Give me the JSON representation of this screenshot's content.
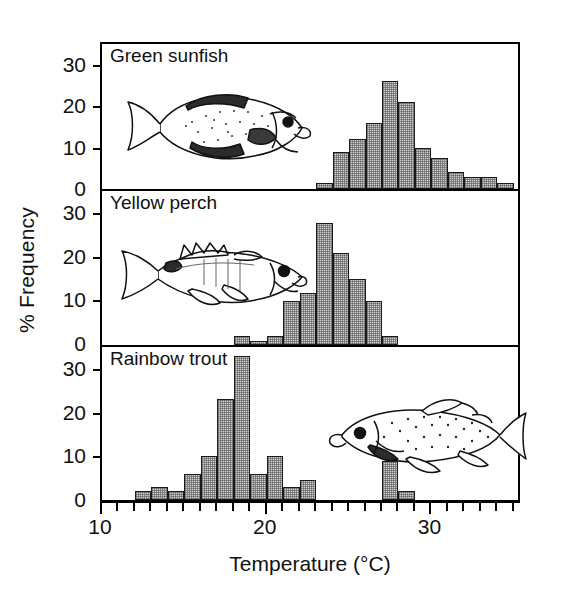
{
  "figure": {
    "xlabel": "Temperature (°C)",
    "ylabel": "% Frequency"
  },
  "axis": {
    "x_major_labels": [
      "10",
      "20",
      "30"
    ],
    "x_major_values": [
      10,
      20,
      30
    ],
    "x_min": 10,
    "x_max": 35.5,
    "x_tick_step": 1,
    "y_labels": [
      "0",
      "10",
      "20",
      "30"
    ],
    "y_values": [
      0,
      10,
      20,
      30
    ]
  },
  "panels": [
    {
      "title": "Green sunfish",
      "fish": "green-sunfish",
      "ymax": 35,
      "ticks": [
        0,
        10,
        20,
        30
      ]
    },
    {
      "title": "Yellow perch",
      "fish": "yellow-perch",
      "ymax": 35,
      "ticks": [
        0,
        10,
        20,
        30
      ]
    },
    {
      "title": "Rainbow trout",
      "fish": "rainbow-trout",
      "ymax": 35,
      "ticks": [
        0,
        10,
        20,
        30
      ]
    }
  ],
  "chart_data": {
    "type": "bar",
    "xlabel": "Temperature (°C)",
    "ylabel": "% Frequency",
    "xlim": [
      10,
      35.5
    ],
    "ylim": [
      0,
      35
    ],
    "grid": false,
    "legend": "none",
    "bin_width": 1,
    "series": [
      {
        "name": "Green sunfish",
        "panel": 0,
        "bins": [
          23,
          24,
          25,
          26,
          27,
          28,
          29,
          30,
          31,
          32,
          33,
          34
        ],
        "values": [
          1.5,
          9,
          12,
          16,
          26,
          21,
          10,
          7.5,
          4,
          3,
          3,
          1.5
        ]
      },
      {
        "name": "Yellow perch",
        "panel": 1,
        "bins": [
          18,
          19,
          20,
          21,
          22,
          23,
          24,
          25,
          26,
          27
        ],
        "values": [
          2,
          1,
          2,
          10,
          12,
          28,
          21,
          15,
          10,
          2
        ]
      },
      {
        "name": "Rainbow trout",
        "panel": 2,
        "bins": [
          12,
          13,
          14,
          15,
          16,
          17,
          18,
          19,
          20,
          21,
          22,
          27,
          28
        ],
        "values": [
          2,
          3,
          2,
          6,
          10,
          23,
          33,
          6,
          10,
          3,
          4.5,
          9,
          2
        ]
      }
    ]
  }
}
